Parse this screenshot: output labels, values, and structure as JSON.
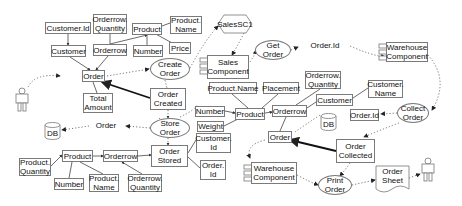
{
  "diagram": {
    "type": "data-flow / object model diagram",
    "actors": [
      {
        "id": "actor_left",
        "label": "",
        "x": 18,
        "y": 88
      },
      {
        "id": "actor_right",
        "label": "",
        "x": 423,
        "y": 158
      }
    ],
    "entities": [
      {
        "id": "customer_id",
        "label": "Customer.Id",
        "x": 45,
        "y": 22,
        "w": 46,
        "h": 12
      },
      {
        "id": "orderrow_qty_top",
        "label": "Orderrow.\nQuantity",
        "x": 93,
        "y": 14,
        "w": 34,
        "h": 20
      },
      {
        "id": "product_top",
        "label": "Product",
        "x": 132,
        "y": 23,
        "w": 30,
        "h": 12
      },
      {
        "id": "product_name_top",
        "label": "Product.\nName",
        "x": 170,
        "y": 16,
        "w": 32,
        "h": 18
      },
      {
        "id": "customer_top",
        "label": "Customer",
        "x": 51,
        "y": 45,
        "w": 35,
        "h": 12
      },
      {
        "id": "orderrow_top",
        "label": "Orderrow",
        "x": 93,
        "y": 44,
        "w": 34,
        "h": 12
      },
      {
        "id": "number_top",
        "label": "Number",
        "x": 133,
        "y": 45,
        "w": 30,
        "h": 12
      },
      {
        "id": "price",
        "label": "Price",
        "x": 169,
        "y": 42,
        "w": 22,
        "h": 12
      },
      {
        "id": "order_top",
        "label": "Order",
        "x": 82,
        "y": 70,
        "w": 23,
        "h": 12
      },
      {
        "id": "total_amount",
        "label": "Total\nAmount",
        "x": 83,
        "y": 93,
        "w": 30,
        "h": 20
      },
      {
        "id": "order_created",
        "label": "Order\nCreated",
        "x": 150,
        "y": 88,
        "w": 36,
        "h": 22
      },
      {
        "id": "product_name_mid",
        "label": "Product.Name",
        "x": 209,
        "y": 82,
        "w": 48,
        "h": 12
      },
      {
        "id": "placement",
        "label": "Placement",
        "x": 263,
        "y": 82,
        "w": 36,
        "h": 12
      },
      {
        "id": "orderrow_qty_mid",
        "label": "Orderrow.\nQuantity",
        "x": 305,
        "y": 71,
        "w": 36,
        "h": 18
      },
      {
        "id": "customer_name",
        "label": "Customer.\nName",
        "x": 368,
        "y": 80,
        "w": 35,
        "h": 18
      },
      {
        "id": "number_mid",
        "label": "Number",
        "x": 195,
        "y": 106,
        "w": 30,
        "h": 11
      },
      {
        "id": "product_mid",
        "label": "Product",
        "x": 235,
        "y": 108,
        "w": 30,
        "h": 12
      },
      {
        "id": "orderrow_mid",
        "label": "Orderrow",
        "x": 272,
        "y": 105,
        "w": 35,
        "h": 12
      },
      {
        "id": "customer_mid",
        "label": "Customer",
        "x": 316,
        "y": 94,
        "w": 37,
        "h": 12
      },
      {
        "id": "weight",
        "label": "Weight",
        "x": 197,
        "y": 121,
        "w": 27,
        "h": 11
      },
      {
        "id": "order_mid",
        "label": "Order",
        "x": 268,
        "y": 131,
        "w": 24,
        "h": 12
      },
      {
        "id": "customer_id_mid",
        "label": "Customer.\nId",
        "x": 196,
        "y": 133,
        "w": 35,
        "h": 20
      },
      {
        "id": "order_id_mid",
        "label": "Order.\nId",
        "x": 200,
        "y": 160,
        "w": 26,
        "h": 20
      },
      {
        "id": "order_id_right",
        "label": "Order.Id",
        "x": 350,
        "y": 109,
        "w": 29,
        "h": 12
      },
      {
        "id": "order_stored",
        "label": "Order\nStored",
        "x": 151,
        "y": 145,
        "w": 37,
        "h": 22
      },
      {
        "id": "order_collected",
        "label": "Order\nCollected",
        "x": 336,
        "y": 139,
        "w": 39,
        "h": 24
      },
      {
        "id": "product_bot",
        "label": "Product",
        "x": 62,
        "y": 150,
        "w": 31,
        "h": 12
      },
      {
        "id": "orderrow_bot",
        "label": "Orderrow",
        "x": 103,
        "y": 150,
        "w": 35,
        "h": 12
      },
      {
        "id": "product_qty",
        "label": "Product.\nQuantity",
        "x": 19,
        "y": 158,
        "w": 32,
        "h": 18
      },
      {
        "id": "number_bot",
        "label": "Number",
        "x": 54,
        "y": 178,
        "w": 30,
        "h": 12
      },
      {
        "id": "product_name_bot",
        "label": "Product.\nName",
        "x": 89,
        "y": 174,
        "w": 30,
        "h": 18
      },
      {
        "id": "orderrow_qty_bot",
        "label": "Orderrow.\nQuantity",
        "x": 128,
        "y": 174,
        "w": 34,
        "h": 18
      }
    ],
    "processes": [
      {
        "id": "create_order",
        "label": "Create\nOrder",
        "x": 150,
        "y": 58,
        "w": 40,
        "h": 22
      },
      {
        "id": "get_order",
        "label": "Get\nOrder",
        "x": 255,
        "y": 40,
        "w": 36,
        "h": 20
      },
      {
        "id": "store_order",
        "label": "Store\nOrder",
        "x": 150,
        "y": 118,
        "w": 40,
        "h": 20
      },
      {
        "id": "collect_order",
        "label": "Collect\nOrder",
        "x": 397,
        "y": 103,
        "w": 32,
        "h": 20
      },
      {
        "id": "print_order",
        "label": "Print\nOrder",
        "x": 318,
        "y": 175,
        "w": 34,
        "h": 20
      }
    ],
    "components": [
      {
        "id": "sales_component",
        "label": "Sales\nComponent",
        "x": 207,
        "y": 55,
        "w": 42,
        "h": 24
      },
      {
        "id": "warehouse_top",
        "label": "Warehouse\nComponent",
        "x": 386,
        "y": 42,
        "w": 42,
        "h": 20
      },
      {
        "id": "warehouse_bot",
        "label": "Warehouse\nComponent",
        "x": 251,
        "y": 162,
        "w": 46,
        "h": 22
      }
    ],
    "hexagons": [
      {
        "id": "salessc1",
        "label": "SalesSC1",
        "x": 218,
        "y": 15,
        "w": 34,
        "h": 18
      }
    ],
    "data_items": [
      {
        "id": "order_id_top",
        "label": "Order.Id",
        "x": 300,
        "y": 36,
        "w": 50,
        "h": 18
      },
      {
        "id": "order_para",
        "label": "Order",
        "x": 89,
        "y": 117,
        "w": 34,
        "h": 16
      }
    ],
    "documents": [
      {
        "id": "order_sheet",
        "label": "Order\nSheet",
        "x": 376,
        "y": 166,
        "w": 33,
        "h": 24
      }
    ],
    "databases": [
      {
        "id": "db_left",
        "label": "DB",
        "x": 45,
        "y": 123,
        "w": 15,
        "h": 16
      },
      {
        "id": "db_right",
        "label": "DB",
        "x": 321,
        "y": 114,
        "w": 15,
        "h": 16
      }
    ]
  }
}
